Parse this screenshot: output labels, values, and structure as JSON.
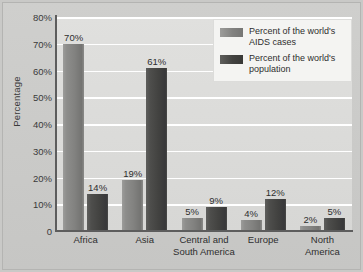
{
  "chart_data": {
    "type": "bar",
    "title": "",
    "xlabel": "",
    "ylabel": "Percentage",
    "ylim": [
      0,
      80
    ],
    "grid": true,
    "legend_position": "top-right",
    "categories": [
      "Africa",
      "Asia",
      "Central and South America",
      "Europe",
      "North America"
    ],
    "category_lines": [
      [
        "Africa"
      ],
      [
        "Asia"
      ],
      [
        "Central and",
        "South America"
      ],
      [
        "Europe"
      ],
      [
        "North",
        "America"
      ]
    ],
    "ytick_labels": [
      "80%",
      "70%",
      "60%",
      "50%",
      "40%",
      "30%",
      "20%",
      "10%",
      "0"
    ],
    "ytick_values": [
      80,
      70,
      60,
      50,
      40,
      30,
      20,
      10,
      0
    ],
    "series": [
      {
        "name": "Percent of the world's AIDS cases",
        "name_lines": [
          "Percent of the world's",
          "AIDS cases"
        ],
        "color": "#828280",
        "values": [
          70,
          19,
          5,
          4,
          2
        ],
        "data_labels": [
          "70%",
          "19%",
          "5%",
          "4%",
          "2%"
        ]
      },
      {
        "name": "Percent of the world's population",
        "name_lines": [
          "Percent of the world's",
          "population"
        ],
        "color": "#424240",
        "values": [
          14,
          61,
          9,
          12,
          5
        ],
        "data_labels": [
          "14%",
          "61%",
          "9%",
          "12%",
          "5%"
        ]
      }
    ]
  },
  "colors": {
    "plot_background": "#dadad8",
    "figure_background": "#c9c9c7",
    "gridline": "#ffffff",
    "axis": "#5d5d5d",
    "series_light": "#828280",
    "series_dark": "#424240",
    "text": "#2e2e2e"
  }
}
